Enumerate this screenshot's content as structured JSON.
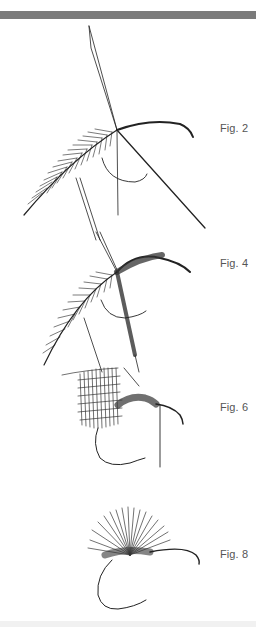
{
  "figures": [
    {
      "id": "fig2",
      "label": "Fig. 2"
    },
    {
      "id": "fig4",
      "label": "Fig. 4"
    },
    {
      "id": "fig6",
      "label": "Fig. 6"
    },
    {
      "id": "fig8",
      "label": "Fig. 8"
    }
  ],
  "colors": {
    "top_bar": "#7b7b7b",
    "ink": "#222222",
    "label": "#555555",
    "bottom_band": "#f1f1f1"
  }
}
